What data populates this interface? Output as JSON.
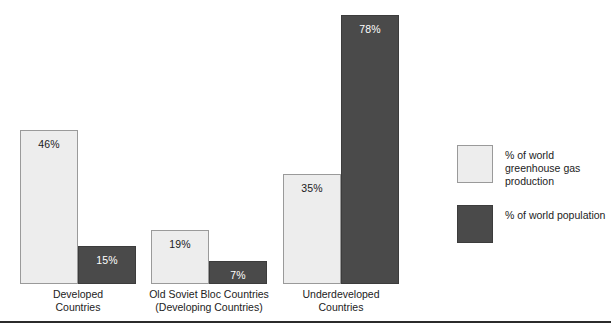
{
  "chart_data": {
    "type": "bar",
    "title": "",
    "subtitle": "",
    "xlabel": "",
    "ylabel": "",
    "ylim": [
      0,
      100
    ],
    "grid": false,
    "legend_position": "right",
    "categories": [
      "Developed\nCountries",
      "Old Soviet Bloc Countries\n(Developing Countries)",
      "Underdeveloped\nCountries"
    ],
    "series": [
      {
        "name": "% of world greenhouse gas production",
        "color": "#ededed",
        "values": [
          46,
          19,
          35
        ],
        "labels": [
          "46%",
          "19%",
          "35%"
        ]
      },
      {
        "name": "% of world population",
        "color": "#4a4a4a",
        "values": [
          15,
          7,
          78
        ],
        "labels": [
          "15%",
          "7%",
          "78%"
        ]
      }
    ]
  },
  "groups": [
    {
      "label_line1": "Developed",
      "label_line2": "Countries",
      "label_left": 18,
      "label_top": 288,
      "label_width": 120,
      "bars": [
        {
          "value_label": "46%",
          "style": "light",
          "left": 20,
          "top": 130,
          "width": 58,
          "height": 154
        },
        {
          "value_label": "15%",
          "style": "dark",
          "left": 78,
          "top": 246,
          "width": 58,
          "height": 38
        }
      ]
    },
    {
      "label_line1": "Old Soviet Bloc Countries",
      "label_line2": "(Developing Countries)",
      "label_left": 139,
      "label_top": 288,
      "label_width": 140,
      "bars": [
        {
          "value_label": "19%",
          "style": "light",
          "left": 151,
          "top": 230,
          "width": 58,
          "height": 54
        },
        {
          "value_label": "7%",
          "style": "dark",
          "left": 209,
          "top": 261,
          "width": 58,
          "height": 23
        }
      ]
    },
    {
      "label_line1": "Underdeveloped",
      "label_line2": "Countries",
      "label_left": 281,
      "label_top": 288,
      "label_width": 120,
      "bars": [
        {
          "value_label": "35%",
          "style": "light",
          "left": 283,
          "top": 174,
          "width": 58,
          "height": 110
        },
        {
          "value_label": "78%",
          "style": "dark",
          "left": 341,
          "top": 15,
          "width": 58,
          "height": 269
        }
      ]
    }
  ],
  "legend": {
    "items": [
      {
        "label": "% of world greenhouse gas production",
        "style": "light"
      },
      {
        "label": "% of world population",
        "style": "dark"
      }
    ]
  },
  "colors": {
    "light_fill": "#ededed",
    "dark_fill": "#4a4a4a",
    "bar_border": "#8c8c8c",
    "rule": "#2b2b2b",
    "text": "#222222"
  }
}
